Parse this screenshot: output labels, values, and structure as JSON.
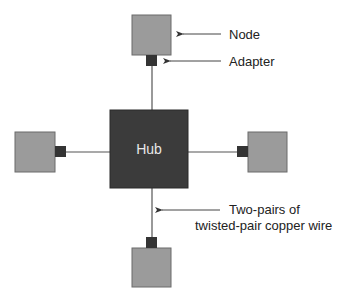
{
  "diagram": {
    "type": "star-topology",
    "hub": {
      "label": "Hub",
      "color": "#3b3b3b"
    },
    "node_color": "#9b9b9b",
    "node_border": "#6b6b6b",
    "adapter_color": "#343434",
    "wire_color": "#555555",
    "nodes": [
      {
        "position": "top"
      },
      {
        "position": "left"
      },
      {
        "position": "right"
      },
      {
        "position": "bottom"
      }
    ],
    "annotations": {
      "node": "Node",
      "adapter": "Adapter",
      "wire_line1": "Two-pairs of",
      "wire_line2": "twisted-pair copper wire"
    }
  }
}
